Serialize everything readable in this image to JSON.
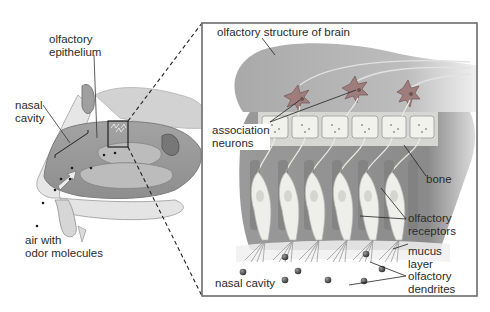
{
  "figure": {
    "type": "anatomical-diagram"
  },
  "overview_panel": {
    "labels": {
      "olfactory_epithelium": [
        "olfactory",
        "epithelium"
      ],
      "nasal_cavity": [
        "nasal",
        "cavity"
      ],
      "air_with_odor_molecules": [
        "air with",
        "odor molecules"
      ]
    }
  },
  "detail_panel": {
    "labels": {
      "olfactory_structure_of_brain": "olfactory structure of brain",
      "association_neurons": [
        "association",
        "neurons"
      ],
      "bone": "bone",
      "olfactory_receptors": [
        "olfactory",
        "receptors"
      ],
      "mucus_layer": [
        "mucus",
        "layer"
      ],
      "olfactory_dendrites": [
        "olfactory",
        "dendrites"
      ],
      "nasal_cavity": "nasal cavity"
    },
    "bone_block_count": 6,
    "neuron_count": 3,
    "receptor_cell_count": 6
  },
  "colors": {
    "frame": "#6b6b6b",
    "tissue_dark": "#8f8f8f",
    "tissue_mid": "#b3b3b3",
    "tissue_light": "#d8d8d8",
    "cell_light": "#eeeeea",
    "text": "#2b2b2b"
  }
}
